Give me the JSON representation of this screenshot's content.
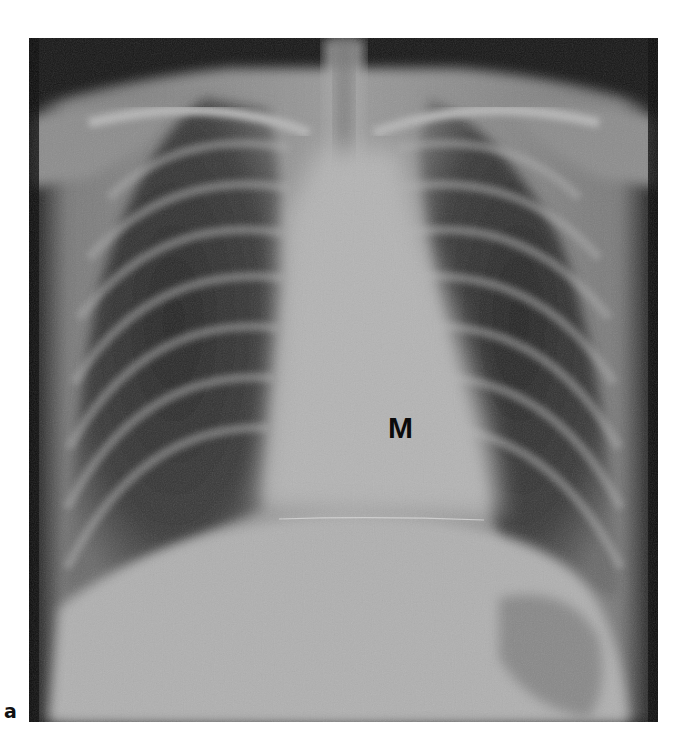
{
  "figure": {
    "panel_label": "a",
    "image_description": "Frontal chest radiograph",
    "annotations": [
      {
        "text": "M",
        "position": "left of midline, over cardiac/mediastinal shadow"
      }
    ]
  }
}
